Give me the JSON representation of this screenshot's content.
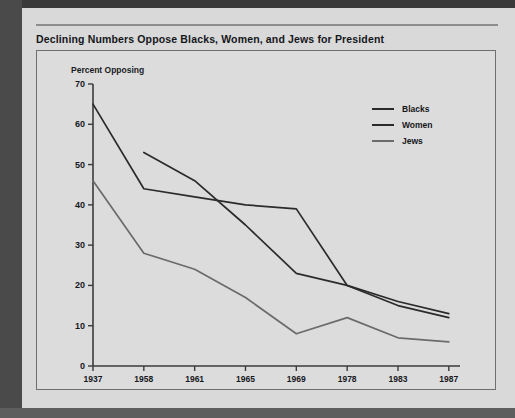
{
  "page": {
    "title": "Declining Numbers Oppose Blacks, Women, and Jews for President"
  },
  "chart_data": {
    "type": "line",
    "title": "Declining Numbers Oppose Blacks, Women, and Jews for President",
    "subtitle": "Percent Opposing",
    "xlabel": "",
    "ylabel": "Percent Opposing",
    "categories": [
      "1937",
      "1958",
      "1961",
      "1965",
      "1969",
      "1978",
      "1983",
      "1987"
    ],
    "ylim": [
      0,
      70
    ],
    "yticks": [
      0,
      10,
      20,
      30,
      40,
      50,
      60,
      70
    ],
    "grid": false,
    "legend_position": "upper-right",
    "series": [
      {
        "name": "Blacks",
        "color": "#2b2b2b",
        "x": [
          "1937",
          "1958",
          "1961",
          "1965",
          "1969",
          "1978",
          "1983",
          "1987"
        ],
        "values": [
          65,
          44,
          42,
          40,
          39,
          20,
          16,
          13
        ]
      },
      {
        "name": "Women",
        "color": "#2b2b2b",
        "x": [
          "1958",
          "1961",
          "1965",
          "1969",
          "1978",
          "1983",
          "1987"
        ],
        "values": [
          53,
          46,
          35,
          23,
          20,
          15,
          12
        ]
      },
      {
        "name": "Jews",
        "color": "#6b6b6b",
        "x": [
          "1937",
          "1958",
          "1961",
          "1965",
          "1969",
          "1978",
          "1983",
          "1987"
        ],
        "values": [
          46,
          28,
          24,
          17,
          8,
          12,
          7,
          6
        ]
      }
    ]
  }
}
